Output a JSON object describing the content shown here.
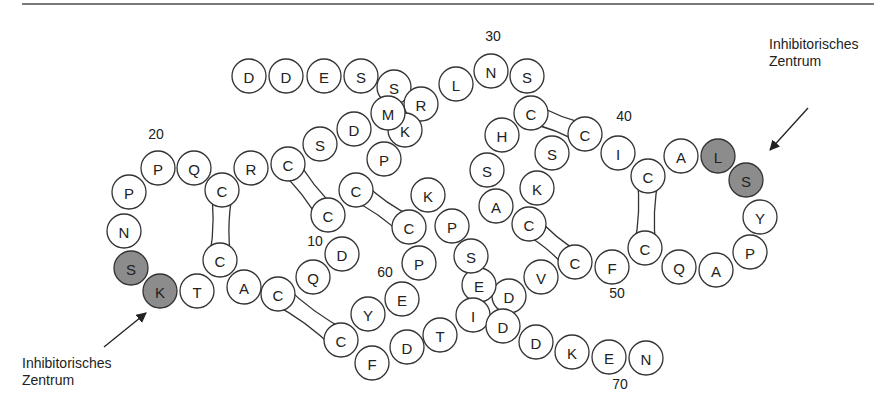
{
  "figure": {
    "title": "",
    "residue_radius": 17,
    "colors": {
      "residue_fill": "#ffffff",
      "inhibitory_fill": "#8c8c8c",
      "stroke": "#333333",
      "rule": "#7a7a7a"
    }
  },
  "labels": {
    "inhibitory_left": {
      "line1": "Inhibitorisches",
      "line2": "Zentrum"
    },
    "inhibitory_right": {
      "line1": "Inhibitorisches",
      "line2": "Zentrum"
    }
  },
  "position_numbers": [
    {
      "text": "10",
      "x": 315,
      "y": 246
    },
    {
      "text": "20",
      "x": 156,
      "y": 139
    },
    {
      "text": "30",
      "x": 493,
      "y": 41
    },
    {
      "text": "40",
      "x": 624,
      "y": 121
    },
    {
      "text": "50",
      "x": 617,
      "y": 298
    },
    {
      "text": "60",
      "x": 385,
      "y": 277
    },
    {
      "text": "70",
      "x": 620,
      "y": 389
    }
  ],
  "residues": [
    {
      "aa": "D",
      "x": 249,
      "y": 76
    },
    {
      "aa": "D",
      "x": 286,
      "y": 76
    },
    {
      "aa": "E",
      "x": 324,
      "y": 76
    },
    {
      "aa": "S",
      "x": 361,
      "y": 76
    },
    {
      "aa": "S",
      "x": 394,
      "y": 87
    },
    {
      "aa": "R",
      "x": 421,
      "y": 104
    },
    {
      "aa": "L",
      "x": 456,
      "y": 84
    },
    {
      "aa": "N",
      "x": 491,
      "y": 71
    },
    {
      "aa": "S",
      "x": 527,
      "y": 76
    },
    {
      "aa": "C",
      "x": 531,
      "y": 113
    },
    {
      "aa": "H",
      "x": 502,
      "y": 135
    },
    {
      "aa": "S",
      "x": 487,
      "y": 170
    },
    {
      "aa": "A",
      "x": 496,
      "y": 206
    },
    {
      "aa": "C",
      "x": 529,
      "y": 224
    },
    {
      "aa": "K",
      "x": 537,
      "y": 188
    },
    {
      "aa": "S",
      "x": 552,
      "y": 153
    },
    {
      "aa": "C",
      "x": 585,
      "y": 134
    },
    {
      "aa": "I",
      "x": 618,
      "y": 153
    },
    {
      "aa": "C",
      "x": 648,
      "y": 176
    },
    {
      "aa": "A",
      "x": 681,
      "y": 156
    },
    {
      "aa": "L",
      "x": 718,
      "y": 156
    },
    {
      "aa": "S",
      "x": 746,
      "y": 180
    },
    {
      "aa": "Y",
      "x": 760,
      "y": 217
    },
    {
      "aa": "P",
      "x": 750,
      "y": 252
    },
    {
      "aa": "A",
      "x": 716,
      "y": 270
    },
    {
      "aa": "Q",
      "x": 679,
      "y": 267
    },
    {
      "aa": "C",
      "x": 645,
      "y": 248
    },
    {
      "aa": "F",
      "x": 612,
      "y": 267
    },
    {
      "aa": "C",
      "x": 575,
      "y": 262
    },
    {
      "aa": "V",
      "x": 541,
      "y": 277
    },
    {
      "aa": "D",
      "x": 509,
      "y": 296
    },
    {
      "aa": "E",
      "x": 479,
      "y": 285
    },
    {
      "aa": "S",
      "x": 471,
      "y": 256
    },
    {
      "aa": "P",
      "x": 452,
      "y": 226
    },
    {
      "aa": "K",
      "x": 428,
      "y": 195
    },
    {
      "aa": "C",
      "x": 409,
      "y": 227
    },
    {
      "aa": "C",
      "x": 356,
      "y": 190
    },
    {
      "aa": "P",
      "x": 384,
      "y": 159
    },
    {
      "aa": "K",
      "x": 405,
      "y": 130
    },
    {
      "aa": "M",
      "x": 388,
      "y": 113
    },
    {
      "aa": "D",
      "x": 354,
      "y": 129
    },
    {
      "aa": "S",
      "x": 320,
      "y": 144
    },
    {
      "aa": "C",
      "x": 288,
      "y": 164
    },
    {
      "aa": "R",
      "x": 251,
      "y": 168
    },
    {
      "aa": "C",
      "x": 222,
      "y": 190
    },
    {
      "aa": "Q",
      "x": 194,
      "y": 168
    },
    {
      "aa": "P",
      "x": 158,
      "y": 168
    },
    {
      "aa": "P",
      "x": 129,
      "y": 192
    },
    {
      "aa": "N",
      "x": 124,
      "y": 231
    },
    {
      "aa": "S",
      "x": 131,
      "y": 268
    },
    {
      "aa": "K",
      "x": 160,
      "y": 291
    },
    {
      "aa": "T",
      "x": 197,
      "y": 291
    },
    {
      "aa": "C",
      "x": 220,
      "y": 260
    },
    {
      "aa": "A",
      "x": 244,
      "y": 287
    },
    {
      "aa": "C",
      "x": 278,
      "y": 294
    },
    {
      "aa": "Q",
      "x": 313,
      "y": 277
    },
    {
      "aa": "D",
      "x": 342,
      "y": 254
    },
    {
      "aa": "C",
      "x": 328,
      "y": 215
    },
    {
      "aa": "C",
      "x": 341,
      "y": 340
    },
    {
      "aa": "F",
      "x": 372,
      "y": 363
    },
    {
      "aa": "D",
      "x": 407,
      "y": 347
    },
    {
      "aa": "T",
      "x": 440,
      "y": 335
    },
    {
      "aa": "I",
      "x": 473,
      "y": 315
    },
    {
      "aa": "D",
      "x": 503,
      "y": 326
    },
    {
      "aa": "D",
      "x": 536,
      "y": 342
    },
    {
      "aa": "K",
      "x": 572,
      "y": 352
    },
    {
      "aa": "E",
      "x": 609,
      "y": 357
    },
    {
      "aa": "N",
      "x": 646,
      "y": 358
    },
    {
      "aa": "Y",
      "x": 368,
      "y": 314
    },
    {
      "aa": "E",
      "x": 402,
      "y": 299
    },
    {
      "aa": "P",
      "x": 419,
      "y": 263
    }
  ],
  "inhibitory_residues": [
    {
      "aa": "S",
      "x": 131,
      "y": 268
    },
    {
      "aa": "K",
      "x": 160,
      "y": 291
    },
    {
      "aa": "L",
      "x": 718,
      "y": 156
    },
    {
      "aa": "S",
      "x": 746,
      "y": 180
    }
  ],
  "disulfide_bonds": [
    {
      "from": [
        222,
        190
      ],
      "to": [
        220,
        260
      ]
    },
    {
      "from": [
        288,
        164
      ],
      "to": [
        328,
        215
      ]
    },
    {
      "from": [
        356,
        190
      ],
      "to": [
        409,
        227
      ]
    },
    {
      "from": [
        278,
        294
      ],
      "to": [
        341,
        340
      ]
    },
    {
      "from": [
        531,
        113
      ],
      "to": [
        585,
        134
      ]
    },
    {
      "from": [
        529,
        224
      ],
      "to": [
        575,
        262
      ]
    },
    {
      "from": [
        648,
        176
      ],
      "to": [
        645,
        248
      ]
    }
  ]
}
